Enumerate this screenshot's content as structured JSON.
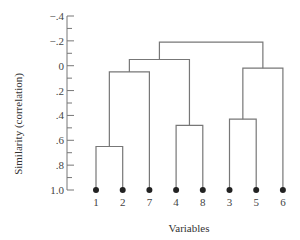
{
  "chart_data": {
    "type": "dendrogram",
    "title": "",
    "xlabel": "Variables",
    "ylabel": "Similarity (correlation)",
    "ylim": [
      -0.4,
      1.0
    ],
    "y_inverted": true,
    "y_ticks": [
      -0.4,
      -0.2,
      0,
      0.2,
      0.4,
      0.6,
      0.8,
      1.0
    ],
    "y_tick_labels": [
      "−.4",
      "−.2",
      "0",
      ".2",
      ".4",
      ".6",
      ".8",
      "1.0"
    ],
    "leaf_order": [
      "1",
      "2",
      "7",
      "4",
      "8",
      "3",
      "5",
      "6"
    ],
    "merges": [
      {
        "clusters": [
          "3",
          "5"
        ],
        "similarity": 0.43
      },
      {
        "clusters": [
          "4",
          "8"
        ],
        "similarity": 0.48
      },
      {
        "clusters": [
          "1",
          "2"
        ],
        "similarity": 0.65
      },
      {
        "clusters": [
          "(1,2)",
          "7"
        ],
        "similarity": 0.05
      },
      {
        "clusters": [
          "(3,5)",
          "6"
        ],
        "similarity": 0.02
      },
      {
        "clusters": [
          "((1,2),7)",
          "(4,8)"
        ],
        "similarity": -0.05
      },
      {
        "clusters": [
          "(((1,2),7),(4,8))",
          "((3,5),6)"
        ],
        "similarity": -0.19
      }
    ],
    "grid": false,
    "legend": null
  },
  "axis": {
    "ylabel": "Similarity (correlation)",
    "xlabel": "Variables"
  },
  "colors": {
    "line": "#777777",
    "leaf_dot": "#222222",
    "text": "#444444"
  }
}
